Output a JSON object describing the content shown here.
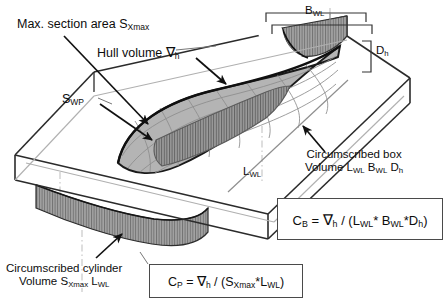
{
  "figure": {
    "kind": "naval-architecture-hull-coefficients-diagram",
    "background_color": "#ffffff",
    "ink_color": "#0d0d0d"
  },
  "annotations": {
    "max_section_area": "Max. section area S",
    "max_section_area_sub": "Xmax",
    "hull_volume": "Hull volume ",
    "hull_volume_symbol": "∇",
    "hull_volume_sub": "h",
    "waterplane_area": "S",
    "waterplane_area_sub": "WP",
    "beam_waterline": "B",
    "beam_waterline_sub": "WL",
    "depth_hull": "D",
    "depth_hull_sub": "h",
    "length_waterline": "L",
    "length_waterline_sub": "WL"
  },
  "callouts": {
    "circumscribed_box": {
      "line1": "Circumscribed box",
      "line2_prefix": "Volume L",
      "line2_sub1": "WL",
      "line2_mid1": " B",
      "line2_sub2": "WL",
      "line2_mid2": " D",
      "line2_sub3": "h"
    },
    "circumscribed_cylinder": {
      "line1": "Circumscribed cylinder",
      "line2_prefix": "Volume S",
      "line2_sub1": "Xmax",
      "line2_mid1": " L",
      "line2_sub2": "WL"
    }
  },
  "formulas": {
    "block_coefficient": {
      "lhs": "C",
      "lhs_sub": "B",
      "eq": " = ",
      "nabla": "∇",
      "nabla_sub": "h",
      "divider": " / (L",
      "s1": "WL",
      "m1": "* B",
      "s2": "WL",
      "m2": "*D",
      "s3": "h",
      "close": ")"
    },
    "prismatic_coefficient": {
      "lhs": "C",
      "lhs_sub": "P",
      "eq": " = ",
      "nabla": "∇",
      "nabla_sub": "h",
      "divider": " / (S",
      "s1": "Xmax",
      "m1": "*L",
      "s2": "WL",
      "close": ")"
    }
  },
  "colors": {
    "hull_surface": "#b4b4b4",
    "hull_mesh_line": "#8a8a8a",
    "hull_outline": "#1a1a1a",
    "transom_dark": "#8f8f8f",
    "section_hatch": "#9a9a9a",
    "box_edge": "#2b2b2b",
    "box_edge_light": "#a8a8a8",
    "centerline": "#b9b9b9",
    "dimension_line": "#3a3a3a"
  }
}
